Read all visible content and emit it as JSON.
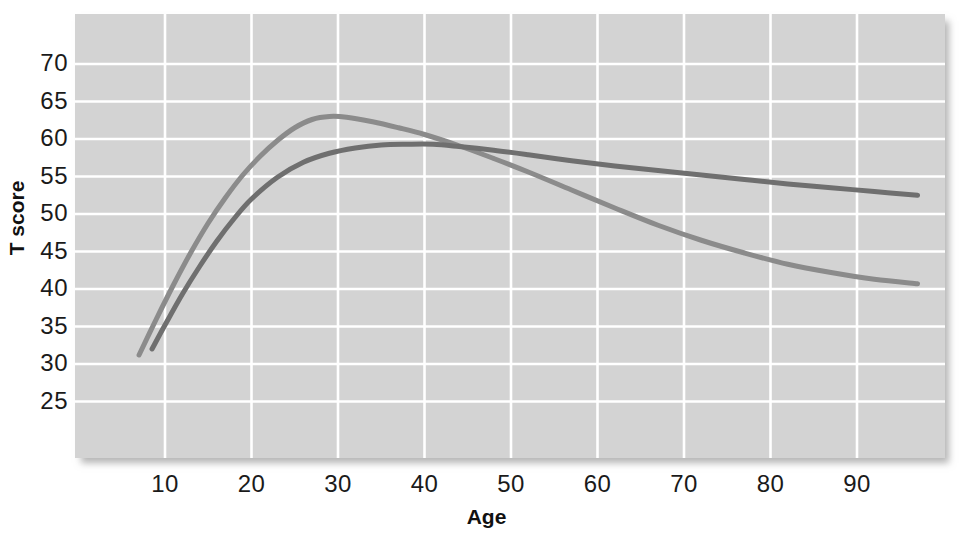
{
  "chart_data": {
    "type": "line",
    "title": "",
    "xlabel": "Age",
    "ylabel": "T score",
    "xlim": [
      6,
      98
    ],
    "ylim": [
      23,
      73
    ],
    "grid": true,
    "legend": "none",
    "x_ticks": [
      10,
      20,
      30,
      40,
      50,
      60,
      70,
      80,
      90
    ],
    "y_ticks": [
      25,
      30,
      35,
      40,
      45,
      50,
      55,
      60,
      65,
      70
    ],
    "plot_background_color": "#d3d3d3",
    "gridline_color": "#ffffff",
    "series": [
      {
        "name": "curve-light",
        "color": "#8b8b8b",
        "x": [
          7,
          9,
          11,
          13,
          15,
          17,
          19,
          21,
          23,
          25,
          27,
          29,
          31,
          34,
          37,
          40,
          44,
          48,
          52,
          57,
          62,
          67,
          72,
          77,
          82,
          87,
          92,
          97
        ],
        "y": [
          31.2,
          36.0,
          40.6,
          44.9,
          48.8,
          52.2,
          55.2,
          57.7,
          59.8,
          61.5,
          62.6,
          63.0,
          62.9,
          62.3,
          61.5,
          60.6,
          59.1,
          57.4,
          55.6,
          53.2,
          50.8,
          48.5,
          46.5,
          44.8,
          43.3,
          42.2,
          41.3,
          40.7
        ]
      },
      {
        "name": "curve-dark",
        "color": "#6f6f6f",
        "x": [
          8.5,
          10,
          12,
          14,
          16,
          18,
          20,
          23,
          26,
          29,
          32,
          35,
          38,
          41,
          44,
          48,
          52,
          57,
          62,
          67,
          72,
          77,
          82,
          87,
          92,
          97
        ],
        "y": [
          32.0,
          35.2,
          39.3,
          43.0,
          46.4,
          49.4,
          52.0,
          54.9,
          56.9,
          58.1,
          58.8,
          59.2,
          59.3,
          59.3,
          59.0,
          58.5,
          57.9,
          57.1,
          56.4,
          55.8,
          55.2,
          54.6,
          54.0,
          53.5,
          53.0,
          52.5
        ]
      }
    ],
    "annotations": {
      "crossover_age": 45,
      "crossover_t_score": 58.4,
      "light_curve_peak": {
        "age": 28.5,
        "t_score": 63.0
      },
      "dark_curve_peak": {
        "age": 39.5,
        "t_score": 59.3
      }
    }
  },
  "axis": {
    "y_title": "T score",
    "x_title": "Age",
    "y_labels": [
      "70",
      "65",
      "60",
      "55",
      "50",
      "45",
      "40",
      "35",
      "30",
      "25"
    ],
    "x_labels": [
      "10",
      "20",
      "30",
      "40",
      "50",
      "60",
      "70",
      "80",
      "90"
    ]
  }
}
